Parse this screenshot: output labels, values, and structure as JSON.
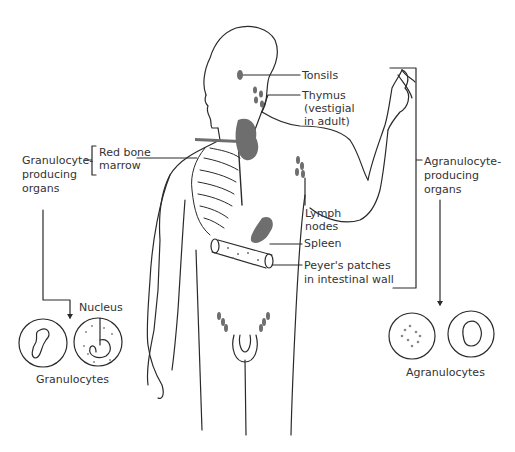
{
  "diagram": {
    "colors": {
      "ink": "#2a2a2a",
      "organ_fill": "#6e6e6e",
      "background": "#ffffff"
    },
    "labels": {
      "tonsils": "Tonsils",
      "thymus_l1": "Thymus",
      "thymus_l2": "(vestigial",
      "thymus_l3": "in adult)",
      "red_bone_l1": "Red bone",
      "red_bone_l2": "marrow",
      "gran_org_l1": "Granulocyte-",
      "gran_org_l2": "producing",
      "gran_org_l3": "organs",
      "agran_org_l1": "Agranulocyte-",
      "agran_org_l2": "producing",
      "agran_org_l3": "organs",
      "lymph_l1": "Lymph",
      "lymph_l2": "nodes",
      "spleen": "Spleen",
      "peyer_l1": "Peyer's patches",
      "peyer_l2": "in intestinal wall",
      "nucleus": "Nucleus",
      "granulocytes": "Granulocytes",
      "agranulocytes": "Agranulocytes"
    },
    "groups": [
      {
        "name": "Granulocyte-producing organs",
        "members": [
          "Red bone marrow"
        ],
        "produces": "Granulocytes"
      },
      {
        "name": "Agranulocyte-producing organs",
        "members": [
          "Tonsils",
          "Thymus (vestigial in adult)",
          "Lymph nodes",
          "Spleen",
          "Peyer's patches in intestinal wall"
        ],
        "produces": "Agranulocytes"
      }
    ]
  }
}
